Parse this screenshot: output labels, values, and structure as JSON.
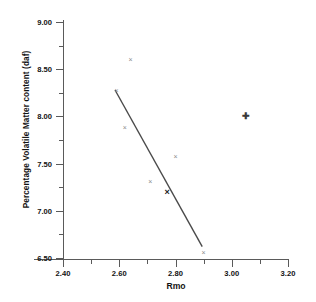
{
  "chart_data": {
    "type": "scatter",
    "title": "",
    "xlabel": "Rmo",
    "ylabel": "Percentage Volatile Matter content (daf)",
    "xlim": [
      2.3,
      3.22
    ],
    "ylim": [
      6.4,
      9.05
    ],
    "grid": false,
    "legend": null,
    "x_ticks_major": [
      "2.40",
      "2.60",
      "2.80",
      "3.00",
      "3.20"
    ],
    "x_ticks_major_values": [
      2.4,
      2.6,
      2.8,
      3.0,
      3.2
    ],
    "x_ticks_minor_values": [
      2.5,
      2.7,
      2.9,
      3.1
    ],
    "y_ticks_major": [
      "9.00",
      "8.50",
      "8.00",
      "7.50",
      "7.00",
      "6.50"
    ],
    "y_ticks_major_values": [
      9.0,
      8.5,
      8.0,
      7.5,
      7.0,
      6.5
    ],
    "y_ticks_minor_values": [
      8.75,
      8.25,
      7.75,
      7.25,
      6.75
    ],
    "points": [
      {
        "x": 2.64,
        "y": 8.6,
        "marker": "x"
      },
      {
        "x": 2.59,
        "y": 8.27,
        "marker": "x"
      },
      {
        "x": 2.62,
        "y": 7.88,
        "marker": "x"
      },
      {
        "x": 2.8,
        "y": 7.58,
        "marker": "x"
      },
      {
        "x": 2.71,
        "y": 7.31,
        "marker": "x"
      },
      {
        "x": 2.77,
        "y": 7.19,
        "marker": "x-bold"
      },
      {
        "x": 3.05,
        "y": 8.0,
        "marker": "plus"
      },
      {
        "x": 2.9,
        "y": 6.56,
        "marker": "x"
      }
    ],
    "trendline": {
      "type": "line",
      "x_start": 2.585,
      "y_start": 8.28,
      "x_end": 2.895,
      "y_end": 6.62,
      "color": "#4a4a4a"
    }
  }
}
